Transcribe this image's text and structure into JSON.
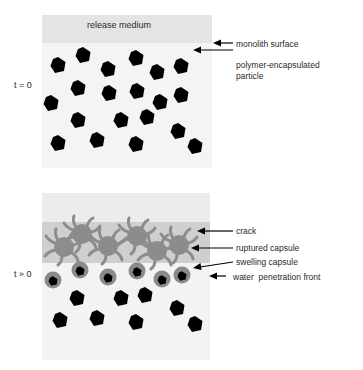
{
  "diagram": {
    "panel_top": {
      "time_label": "t = 0",
      "band_label": "release medium",
      "annotations": [
        {
          "id": "monolith-surface",
          "text": "monolith surface"
        },
        {
          "id": "polymer-encapsulated-particle",
          "text": "polymer-encapsulated particle",
          "line1": "polymer-encapsulated",
          "line2": "particle"
        }
      ],
      "particle_count": 21
    },
    "panel_bottom": {
      "time_label": "t » 0",
      "annotations": [
        {
          "id": "crack",
          "text": "crack"
        },
        {
          "id": "ruptured-capsule",
          "text": "ruptured capsule"
        },
        {
          "id": "swelling-capsule",
          "text": "swelling capsule"
        },
        {
          "id": "water-penetration-front",
          "text": "water  penetration front"
        }
      ],
      "ruptured_capsule_count": 6,
      "swelling_capsule_count": 6,
      "intact_particle_count": 8
    },
    "colors": {
      "release_medium": "#e4e4e4",
      "monolith": "#f4f4f4",
      "crack_zone": "#cfcfcf",
      "ruptured_capsule": "#8c8c8c",
      "swelling_shell": "#8a8a8a",
      "particle": "#000000"
    }
  }
}
